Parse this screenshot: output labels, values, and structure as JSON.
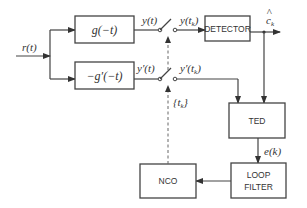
{
  "diagram": {
    "type": "block-diagram",
    "input": {
      "label": "r(t)"
    },
    "blocks": [
      {
        "id": "mf",
        "label": "g(−t)"
      },
      {
        "id": "dmf",
        "label": "−g′(−t)"
      },
      {
        "id": "detector",
        "label": "DETECTOR"
      },
      {
        "id": "ted",
        "label": "TED"
      },
      {
        "id": "loop_filter",
        "label_line1": "LOOP",
        "label_line2": "FILTER"
      },
      {
        "id": "nco",
        "label": "NCO"
      }
    ],
    "signals": {
      "mf_out": "y(t)",
      "dmf_out": "y′(t)",
      "sampled_mf": "y(t",
      "sampled_mf_sub": "k",
      "sampled_dmf": "y′(t",
      "sampled_dmf_sub": "k",
      "decision": "c",
      "decision_sub": "k",
      "decision_hat": "^",
      "error": "e(k)",
      "sample_times": "{t",
      "sample_times_sub": "k",
      "sample_times_end": "}"
    },
    "edges": [
      [
        "r(t)",
        "mf"
      ],
      [
        "r(t)",
        "dmf"
      ],
      [
        "mf",
        "switch1"
      ],
      [
        "dmf",
        "switch2"
      ],
      [
        "switch1",
        "detector"
      ],
      [
        "switch2",
        "ted"
      ],
      [
        "detector",
        "output"
      ],
      [
        "detector",
        "ted"
      ],
      [
        "ted",
        "loop_filter"
      ],
      [
        "loop_filter",
        "nco"
      ],
      [
        "nco",
        "switch1 (dashed)"
      ],
      [
        "nco",
        "switch2 (dashed)"
      ]
    ]
  }
}
